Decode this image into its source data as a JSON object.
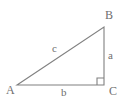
{
  "figure": {
    "type": "right-triangle-diagram",
    "background_color": "#ffffff",
    "stroke_color": "#808080",
    "label_color": "#6e6e6e",
    "canvas": {
      "width": 126,
      "height": 109
    },
    "vertices": [
      {
        "id": "A",
        "label": "A",
        "x": 17,
        "y": 85
      },
      {
        "id": "B",
        "label": "B",
        "x": 104,
        "y": 27
      },
      {
        "id": "C",
        "label": "C",
        "x": 104,
        "y": 85
      }
    ],
    "sides": [
      {
        "id": "a",
        "label": "a",
        "from": "B",
        "to": "C",
        "role": "vertical-leg"
      },
      {
        "id": "b",
        "label": "b",
        "from": "A",
        "to": "C",
        "role": "horizontal-leg"
      },
      {
        "id": "c",
        "label": "c",
        "from": "A",
        "to": "B",
        "role": "hypotenuse"
      }
    ],
    "right_angle": {
      "at_vertex": "C",
      "marker": "right-angle-square",
      "size": 7
    },
    "paths": {
      "triangle": "M 17 85 L 104 27 L 104 85 Z",
      "right_angle_square": "M 97 85 L 97 78 L 104 78"
    }
  }
}
